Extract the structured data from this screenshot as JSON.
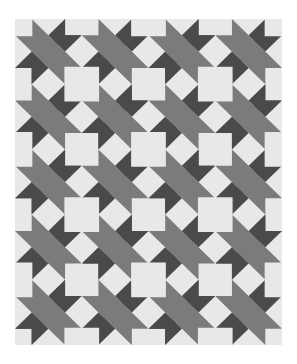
{
  "image": {
    "subject": "quilt-pattern",
    "description": "Geometric quilt block pattern with diagonal bands, star points, and light squares",
    "grid": {
      "columns": 4,
      "rows": 5
    },
    "colors": {
      "background": "#ffffff",
      "light": "#e8e8e8",
      "medium": "#7b7b7b",
      "dark": "#4a4a4a"
    }
  }
}
